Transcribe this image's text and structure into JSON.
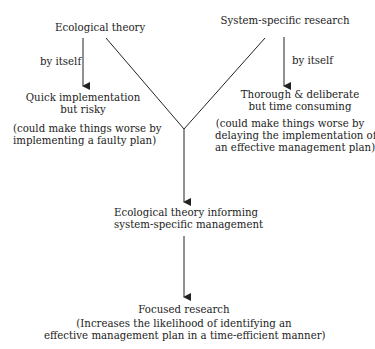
{
  "nodes": {
    "ecological_theory": "Ecological theory",
    "system_research": "System-specific research",
    "left_edge_label": "by itself",
    "right_edge_label": "by itself",
    "quick_title_1": "Quick implementation",
    "quick_title_2": "but risky",
    "quick_note_1": "(could make things worse by",
    "quick_note_2": "implementing a faulty plan)",
    "thorough_title_1": "Thorough & deliberate",
    "thorough_title_2": "but time consuming",
    "thorough_note_1": "(could make things worse by",
    "thorough_note_2": "delaying the implementation of",
    "thorough_note_3": "an effective management plan)",
    "informing_1": "Ecological theory informing",
    "informing_2": "system-specific management",
    "focused_title": "Focused research",
    "focused_note_1": "(Increases the likelihood of identifying an",
    "focused_note_2": "effective management plan in a time-efficient manner)"
  },
  "colors": {
    "line": "#222222",
    "text": "#222222"
  }
}
